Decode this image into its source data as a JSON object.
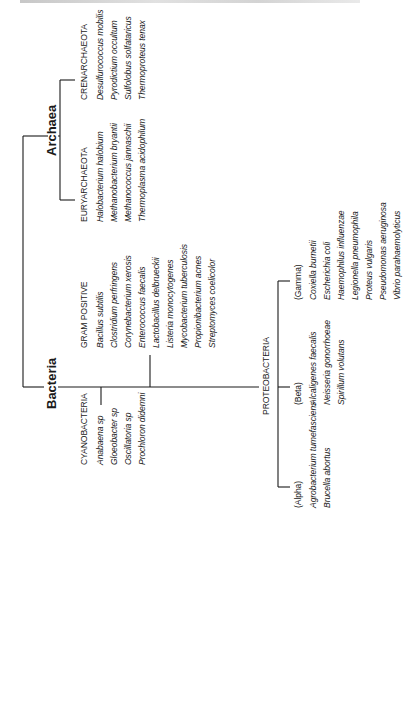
{
  "title_strip": "",
  "tree": {
    "domains": [
      {
        "label": "Archaea",
        "groups": [
          {
            "label": "CRENARCHAEOTA",
            "species": [
              "Desulfurococcus mobilis",
              "Pyrodictium occultum",
              "Sulfolobus solfataricus",
              "Thermoproteus tenax"
            ]
          },
          {
            "label": "EURYARCHAEOTA",
            "species": [
              "Halobacterium halobium",
              "Methanobacterium bryantii",
              "Methanococcus jannaschii",
              "Thermoplasma acidophilum"
            ]
          }
        ]
      },
      {
        "label": "Bacteria",
        "groups": [
          {
            "label": "CYANOBACTERIA",
            "species": [
              "Anabaena sp",
              "Gloeobacter sp",
              "Oscillatoria sp",
              "Prochloron didemni"
            ]
          },
          {
            "label": "GRAM POSITIVE",
            "species": [
              "Bacillus subtilis",
              "Clostridium perfringens",
              "Corynebacterium xerosis",
              "Enterococcus faecalis",
              "Lactobacillus delbrueckii",
              "Listeria monocytogenes",
              "Mycobacterium tuberculosis",
              "Propionibacterium acnes",
              "Streptomyces coelicolor"
            ]
          },
          {
            "label": "PROTEOBACTERIA",
            "subgroups": [
              {
                "label": "(Alpha)",
                "species": [
                  "Agrobacterium tumefasciens",
                  "Brucella abortus"
                ]
              },
              {
                "label": "(Beta)",
                "species": [
                  "Alcaligenes faecalis",
                  "Neisseria gonorrhoeae",
                  "Spirillum volutans"
                ]
              },
              {
                "label": "(Gamma)",
                "species": [
                  "Coxiella burnetii",
                  "Escherichia coli",
                  "Haemophilus influenzae",
                  "Legionella pneumophila",
                  "Proteus vulgaris",
                  "Pseudomonas aeruginosa",
                  "Vibrio parahaemolyticus"
                ]
              }
            ]
          }
        ]
      }
    ]
  },
  "colors": {
    "line": "#1a1a1a",
    "text": "#1a1a1a",
    "background": "#ffffff"
  }
}
